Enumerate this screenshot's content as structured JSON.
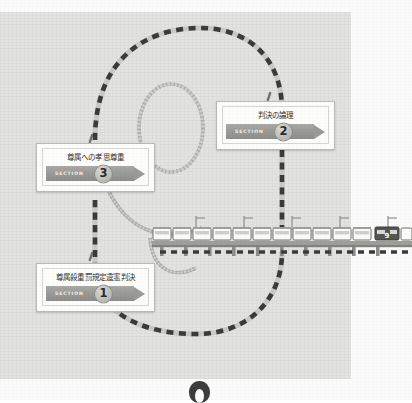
{
  "page": {
    "background_color": "#fbfbfb",
    "panel_color": "#e3e3e1"
  },
  "colors": {
    "track_dark": "#3b3b3b",
    "banner_gray": "#9a9a97",
    "rail_gray": "#9b9b98",
    "box_border": "#b9b9b6",
    "text": "#2f2f2f"
  },
  "callouts": [
    {
      "id": "section-2",
      "title": "判決の論理",
      "section_label": "SECTION",
      "number": "2"
    },
    {
      "id": "section-3",
      "title": "尊属への孝思尊重",
      "section_label": "SECTION",
      "number": "3"
    },
    {
      "id": "section-1",
      "title": "尊属殺重罰規定違憲判決",
      "section_label": "SECTION",
      "number": "1"
    }
  ],
  "train": {
    "car_count": 12,
    "last_car_marking": "9"
  }
}
